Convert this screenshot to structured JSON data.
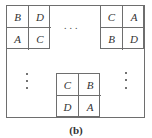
{
  "figure": {
    "caption": "(b)",
    "ellipsis": "...",
    "blocks": {
      "top_left": {
        "cells": [
          "B",
          "D",
          "A",
          "C"
        ]
      },
      "top_right": {
        "cells": [
          "C",
          "A",
          "B",
          "D"
        ]
      },
      "bottom_center": {
        "cells": [
          "C",
          "B",
          "D",
          "A"
        ]
      }
    },
    "colors": {
      "line": "#6e6e6e",
      "text": "#333333"
    }
  }
}
